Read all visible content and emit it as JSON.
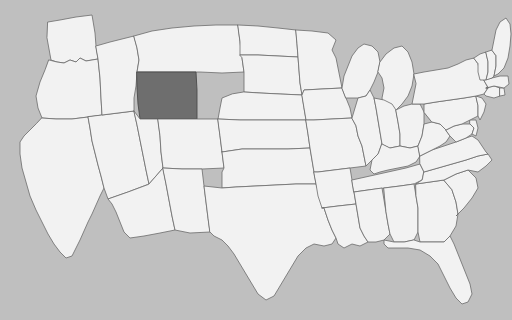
{
  "map": {
    "title": "United States state map",
    "type": "choropleth",
    "projection": "albers-usa",
    "width": 512,
    "height": 320,
    "colors": {
      "background": "#bfbfbf",
      "state_fill": "#f2f2f2",
      "state_border": "#6b6b6b",
      "highlight_fill": "#6e6e6e",
      "highlight_border": "#4a4a4a"
    },
    "highlighted_states": [
      "WY"
    ],
    "legend": null,
    "labels_visible": false,
    "states": [
      {
        "code": "WA",
        "name": "Washington",
        "highlighted": false
      },
      {
        "code": "OR",
        "name": "Oregon",
        "highlighted": false
      },
      {
        "code": "CA",
        "name": "California",
        "highlighted": false
      },
      {
        "code": "NV",
        "name": "Nevada",
        "highlighted": false
      },
      {
        "code": "ID",
        "name": "Idaho",
        "highlighted": false
      },
      {
        "code": "MT",
        "name": "Montana",
        "highlighted": false
      },
      {
        "code": "WY",
        "name": "Wyoming",
        "highlighted": true
      },
      {
        "code": "UT",
        "name": "Utah",
        "highlighted": false
      },
      {
        "code": "AZ",
        "name": "Arizona",
        "highlighted": false
      },
      {
        "code": "CO",
        "name": "Colorado",
        "highlighted": false
      },
      {
        "code": "NM",
        "name": "New Mexico",
        "highlighted": false
      },
      {
        "code": "ND",
        "name": "North Dakota",
        "highlighted": false
      },
      {
        "code": "SD",
        "name": "South Dakota",
        "highlighted": false
      },
      {
        "code": "NE",
        "name": "Nebraska",
        "highlighted": false
      },
      {
        "code": "KS",
        "name": "Kansas",
        "highlighted": false
      },
      {
        "code": "OK",
        "name": "Oklahoma",
        "highlighted": false
      },
      {
        "code": "TX",
        "name": "Texas",
        "highlighted": false
      },
      {
        "code": "MN",
        "name": "Minnesota",
        "highlighted": false
      },
      {
        "code": "IA",
        "name": "Iowa",
        "highlighted": false
      },
      {
        "code": "MO",
        "name": "Missouri",
        "highlighted": false
      },
      {
        "code": "AR",
        "name": "Arkansas",
        "highlighted": false
      },
      {
        "code": "LA",
        "name": "Louisiana",
        "highlighted": false
      },
      {
        "code": "WI",
        "name": "Wisconsin",
        "highlighted": false
      },
      {
        "code": "IL",
        "name": "Illinois",
        "highlighted": false
      },
      {
        "code": "MI",
        "name": "Michigan",
        "highlighted": false
      },
      {
        "code": "IN",
        "name": "Indiana",
        "highlighted": false
      },
      {
        "code": "OH",
        "name": "Ohio",
        "highlighted": false
      },
      {
        "code": "KY",
        "name": "Kentucky",
        "highlighted": false
      },
      {
        "code": "TN",
        "name": "Tennessee",
        "highlighted": false
      },
      {
        "code": "MS",
        "name": "Mississippi",
        "highlighted": false
      },
      {
        "code": "AL",
        "name": "Alabama",
        "highlighted": false
      },
      {
        "code": "GA",
        "name": "Georgia",
        "highlighted": false
      },
      {
        "code": "FL",
        "name": "Florida",
        "highlighted": false
      },
      {
        "code": "SC",
        "name": "South Carolina",
        "highlighted": false
      },
      {
        "code": "NC",
        "name": "North Carolina",
        "highlighted": false
      },
      {
        "code": "VA",
        "name": "Virginia",
        "highlighted": false
      },
      {
        "code": "WV",
        "name": "West Virginia",
        "highlighted": false
      },
      {
        "code": "MD",
        "name": "Maryland",
        "highlighted": false
      },
      {
        "code": "DE",
        "name": "Delaware",
        "highlighted": false
      },
      {
        "code": "PA",
        "name": "Pennsylvania",
        "highlighted": false
      },
      {
        "code": "NJ",
        "name": "New Jersey",
        "highlighted": false
      },
      {
        "code": "NY",
        "name": "New York",
        "highlighted": false
      },
      {
        "code": "CT",
        "name": "Connecticut",
        "highlighted": false
      },
      {
        "code": "RI",
        "name": "Rhode Island",
        "highlighted": false
      },
      {
        "code": "MA",
        "name": "Massachusetts",
        "highlighted": false
      },
      {
        "code": "VT",
        "name": "Vermont",
        "highlighted": false
      },
      {
        "code": "NH",
        "name": "New Hampshire",
        "highlighted": false
      },
      {
        "code": "ME",
        "name": "Maine",
        "highlighted": false
      }
    ]
  }
}
